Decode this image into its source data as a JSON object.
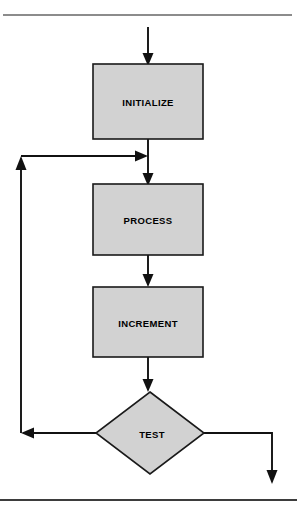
{
  "figure": {
    "type": "flowchart",
    "orientation": "vertical",
    "background_color": "#ffffff",
    "node_fill_color": "#d2d2d2",
    "node_border_color": "#1a1a1a",
    "edge_color": "#111111",
    "rules": {
      "top_rule_color": "#8c8c8c",
      "bottom_rule_color": "#3d3d3d"
    }
  },
  "nodes": [
    {
      "id": "initialize",
      "label": "INITIALIZE",
      "shape": "rectangle",
      "x": 93,
      "y": 64,
      "width": 110,
      "height": 75,
      "center_x": 148,
      "center_y": 101
    },
    {
      "id": "process",
      "label": "PROCESS",
      "shape": "rectangle",
      "x": 93,
      "y": 184,
      "width": 110,
      "height": 71,
      "center_x": 148,
      "center_y": 219
    },
    {
      "id": "increment",
      "label": "INCREMENT",
      "shape": "rectangle",
      "x": 93,
      "y": 287,
      "width": 110,
      "height": 70,
      "center_x": 148,
      "center_y": 322
    },
    {
      "id": "test",
      "label": "TEST",
      "shape": "diamond",
      "x": 96,
      "y": 392,
      "width": 108,
      "height": 82,
      "center_x": 150,
      "center_y": 433
    }
  ],
  "edges": [
    {
      "id": "entry-to-initialize",
      "from": "entry-point",
      "to": "initialize",
      "arrowhead": "down"
    },
    {
      "id": "initialize-to-process",
      "from": "initialize",
      "to": "process",
      "arrowhead": "down"
    },
    {
      "id": "loop-return-into-junction",
      "from": "test",
      "to": "junction",
      "arrowhead": "right"
    },
    {
      "id": "process-to-increment",
      "from": "process",
      "to": "increment",
      "arrowhead": "down"
    },
    {
      "id": "increment-to-test",
      "from": "increment",
      "to": "test",
      "arrowhead": "down"
    },
    {
      "id": "test-loop-back-left",
      "from": "test",
      "to": "loop-riser",
      "arrowhead": "left"
    },
    {
      "id": "loop-riser-up",
      "from": "loop-riser",
      "to": "junction",
      "arrowhead": "up"
    },
    {
      "id": "test-exit-right",
      "from": "test",
      "to": "exit-point",
      "arrowhead": "down"
    }
  ]
}
